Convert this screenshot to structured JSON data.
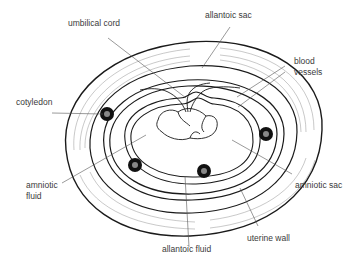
{
  "diagram": {
    "labels": {
      "umbilical_cord": "umbilical cord",
      "allantoic_sac": "allantoic sac",
      "blood_vessels_line1": "blood",
      "blood_vessels_line2": "vessels",
      "cotyledon": "cotyledon",
      "amniotic_fluid_line1": "amniotic",
      "amniotic_fluid_line2": "fluid",
      "amniotic_sac": "amniotic sac",
      "allantoic_fluid": "allantoic fluid",
      "uterine_wall": "uterine wall"
    },
    "colors": {
      "line": "#1a1a1a",
      "leader": "#555555",
      "text": "#3a3a3a",
      "background": "#ffffff"
    }
  }
}
